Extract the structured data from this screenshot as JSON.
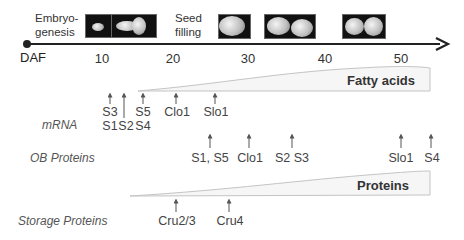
{
  "timeline": {
    "unit_label": "DAF",
    "ticks": [
      "10",
      "20",
      "30",
      "40",
      "50"
    ],
    "stages": [
      {
        "label_line1": "Embryo-",
        "label_line2": "genesis"
      },
      {
        "label_line1": "Seed",
        "label_line2": "filling"
      }
    ],
    "colors": {
      "axis": "#222222",
      "wedge_fill": "#f5f5f5",
      "wedge_stroke": "#bbbbbb",
      "arrow": "#555555"
    }
  },
  "rows": {
    "mrna": {
      "label": "mRNA",
      "markers": [
        {
          "label": "S3",
          "label2": "S1"
        },
        {
          "label": "",
          "label2": "S2"
        },
        {
          "label": "S5",
          "label2": "S4"
        },
        {
          "label": "Clo1"
        },
        {
          "label": "Slo1"
        }
      ]
    },
    "ob_proteins": {
      "label": "OB Proteins",
      "markers": [
        {
          "label": "S1, S5"
        },
        {
          "label": "Clo1"
        },
        {
          "label": "S2 S3"
        },
        {
          "label": "Slo1"
        },
        {
          "label": "S4"
        }
      ]
    },
    "storage_proteins": {
      "label": "Storage Proteins",
      "markers": [
        {
          "label": "Cru2/3"
        },
        {
          "label": "Cru4"
        }
      ]
    }
  },
  "wedges": {
    "fatty_acids": {
      "label": "Fatty acids"
    },
    "proteins": {
      "label": "Proteins"
    }
  }
}
